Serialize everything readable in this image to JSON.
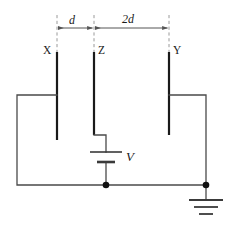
{
  "figure": {
    "type": "circuit-diagram",
    "width": 233,
    "height": 233,
    "background_color": "#ffffff",
    "wire_color": "#444444",
    "plate_color": "#1a1a1a",
    "guide_color": "#9a9a9a",
    "text_color": "#1a1a1a"
  },
  "plates": [
    {
      "id": "X",
      "label": "X",
      "x": 57,
      "top": 52,
      "bottom": 140,
      "label_side": "left"
    },
    {
      "id": "Z",
      "label": "Z",
      "x": 94,
      "top": 52,
      "bottom": 135,
      "label_side": "right"
    },
    {
      "id": "Y",
      "label": "Y",
      "x": 169,
      "top": 52,
      "bottom": 135,
      "label_side": "right"
    }
  ],
  "dimensions": [
    {
      "id": "d",
      "label": "d",
      "from_plate": "X",
      "to_plate": "Z",
      "value": "d",
      "arrow_y": 28
    },
    {
      "id": "2d",
      "label": "2d",
      "from_plate": "Z",
      "to_plate": "Y",
      "value": "2d",
      "arrow_y": 28
    }
  ],
  "source": {
    "label": "V",
    "type": "battery",
    "terminal_long_y": 152,
    "terminal_short_y": 162
  },
  "ground": {
    "label": "",
    "type": "earth-ground",
    "x": 206,
    "y": 192
  },
  "junctions": [
    {
      "id": "battery-bottom-node",
      "x": 106,
      "y": 185
    },
    {
      "id": "ground-node",
      "x": 206,
      "y": 185
    }
  ],
  "wires": [
    {
      "id": "x-plate-to-left-rail",
      "path": "M57,95 L17,95 L17,185 L106,185"
    },
    {
      "id": "z-plate-to-battery",
      "path": "M94,135 L106,135 L106,152"
    },
    {
      "id": "battery-to-bottom-rail",
      "path": "M106,162 L106,185"
    },
    {
      "id": "y-plate-to-right-rail",
      "path": "M169,95 L206,95 L206,185"
    },
    {
      "id": "bottom-rail",
      "path": "M106,185 L206,185"
    },
    {
      "id": "ground-stem",
      "path": "M206,185 L206,200"
    }
  ]
}
